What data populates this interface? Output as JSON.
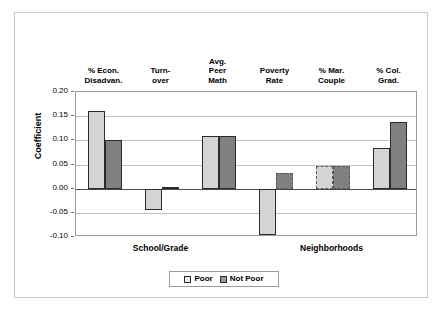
{
  "chart_data": {
    "type": "bar",
    "title": "",
    "xlabel": "",
    "ylabel": "Coefficient",
    "ylim": [
      -0.1,
      0.2
    ],
    "ytick_labels": [
      "0.20",
      "0.15",
      "0.10",
      "0.05",
      "0.00",
      "-0.05",
      "-0.10"
    ],
    "ytick_values": [
      0.2,
      0.15,
      0.1,
      0.05,
      0.0,
      -0.05,
      -0.1
    ],
    "grid": true,
    "legend_position": "bottom-center",
    "categories": [
      "% Econ.\nDisadvan.",
      "Turn-\nover",
      "Avg.\nPeer\nMath",
      "Poverty\nRate",
      "% Mar.\nCouple",
      "% Col.\nGrad."
    ],
    "group_labels": [
      "School/Grade",
      "Neighborhoods"
    ],
    "group_spans": [
      [
        0,
        2
      ],
      [
        3,
        5
      ]
    ],
    "series": [
      {
        "name": "Poor",
        "color": "#d4d4d4",
        "values": [
          0.16,
          -0.045,
          0.108,
          -0.095,
          0.047,
          0.084
        ],
        "borders": [
          "solid",
          "solid",
          "solid",
          "solid",
          "dashed",
          "solid"
        ]
      },
      {
        "name": "Not Poor",
        "color": "#808080",
        "values": [
          0.101,
          0.003,
          0.108,
          0.033,
          0.047,
          0.137
        ],
        "borders": [
          "solid",
          "solid",
          "solid",
          "dashed",
          "dashed",
          "solid"
        ]
      }
    ]
  },
  "legend": {
    "items": [
      {
        "label": "Poor",
        "swatch": "poor"
      },
      {
        "label": "Not Poor",
        "swatch": "notpoor"
      }
    ]
  }
}
